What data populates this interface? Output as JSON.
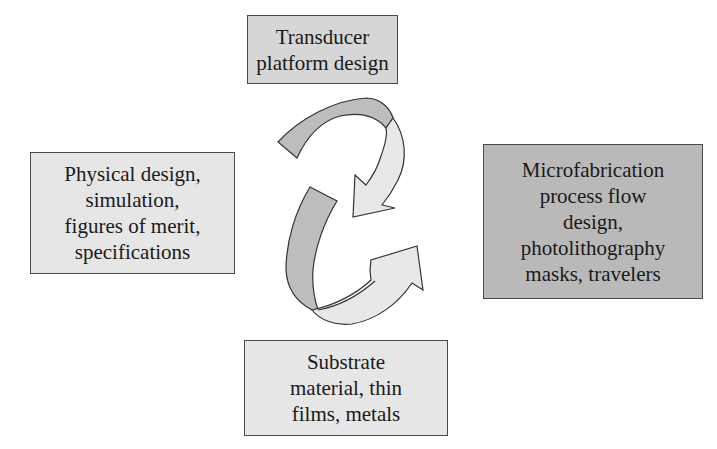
{
  "diagram": {
    "type": "cyclic process",
    "boxes": {
      "top": {
        "lines": [
          "Transducer",
          "platform design"
        ]
      },
      "left": {
        "lines": [
          "Physical design,",
          "simulation,",
          "figures of merit,",
          "specifications"
        ]
      },
      "right": {
        "lines": [
          "Microfabrication",
          "process flow",
          "design,",
          "photolithography",
          "masks, travelers"
        ]
      },
      "bottom": {
        "lines": [
          "Substrate",
          "material, thin",
          "films, metals"
        ]
      }
    },
    "arrows": [
      {
        "name": "upper-arrow",
        "direction": "clockwise",
        "points_toward": "center"
      },
      {
        "name": "lower-arrow",
        "direction": "counter-clockwise",
        "points_toward": "right box"
      }
    ],
    "colors": {
      "box_light": "#e6e6e6",
      "box_mid": "#d6d6d6",
      "box_dark": "#b9b9b9",
      "arrow_dark": "#bdbdbd",
      "arrow_light": "#e8e8e8",
      "outline": "#333333"
    }
  }
}
